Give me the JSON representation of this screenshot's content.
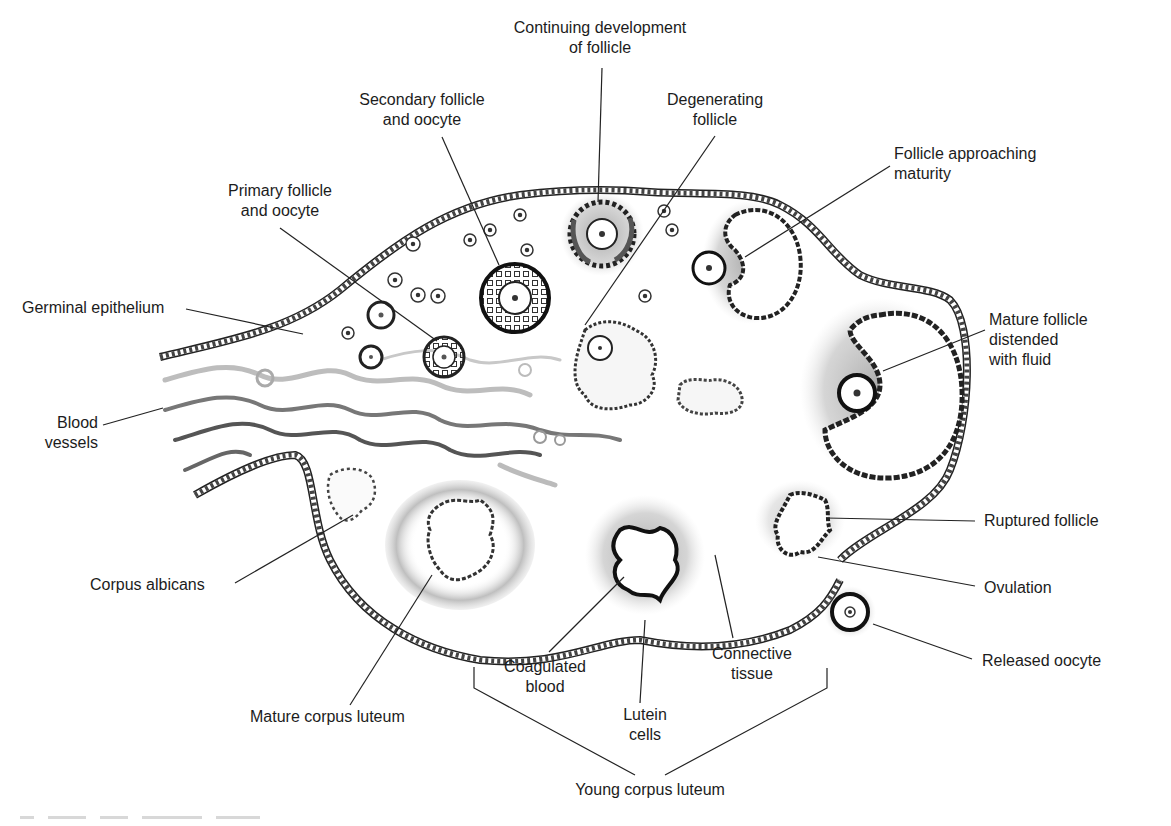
{
  "figure": {
    "colors": {
      "ink": "#1c1c1c",
      "shading": "#9a9a9a",
      "background": "#ffffff"
    }
  },
  "labels": {
    "continuing_development": {
      "line1": "Continuing development",
      "line2": "of follicle"
    },
    "secondary_follicle": {
      "line1": "Secondary follicle",
      "line2": "and oocyte"
    },
    "degenerating_follicle": {
      "line1": "Degenerating",
      "line2": "follicle"
    },
    "follicle_approaching": {
      "line1": "Follicle approaching",
      "line2": "maturity"
    },
    "primary_follicle": {
      "line1": "Primary follicle",
      "line2": "and oocyte"
    },
    "germinal_epithelium": {
      "line1": "Germinal epithelium"
    },
    "mature_follicle": {
      "line1": "Mature follicle",
      "line2": "distended",
      "line3": "with fluid"
    },
    "blood_vessels": {
      "line1": "Blood",
      "line2": "vessels"
    },
    "ruptured_follicle": {
      "line1": "Ruptured follicle"
    },
    "corpus_albicans": {
      "line1": "Corpus albicans"
    },
    "ovulation": {
      "line1": "Ovulation"
    },
    "coagulated_blood": {
      "line1": "Coagulated",
      "line2": "blood"
    },
    "connective_tissue": {
      "line1": "Connective",
      "line2": "tissue"
    },
    "released_oocyte": {
      "line1": "Released oocyte"
    },
    "lutein_cells": {
      "line1": "Lutein",
      "line2": "cells"
    },
    "mature_corpus_luteum": {
      "line1": "Mature corpus luteum"
    },
    "young_corpus_luteum": {
      "line1": "Young corpus luteum"
    }
  }
}
